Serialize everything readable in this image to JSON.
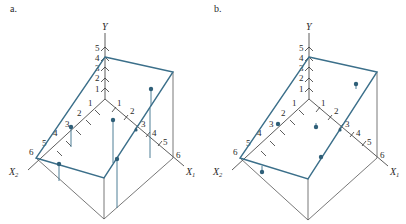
{
  "figure": {
    "panels": [
      {
        "id": "a",
        "label": "a.",
        "y_axis": {
          "label": "Y",
          "ticks": [
            "1",
            "2",
            "3",
            "4",
            "5"
          ]
        },
        "x1_axis": {
          "label": "X",
          "subscript": "1",
          "ticks": [
            "1",
            "2",
            "3",
            "4",
            "5",
            "6"
          ]
        },
        "x2_axis": {
          "label": "X",
          "subscript": "2",
          "ticks": [
            "1",
            "2",
            "3",
            "4",
            "5",
            "6"
          ]
        },
        "description": "Regression plane with data points; vertical stems connect each point to the plane (long residual lines)"
      },
      {
        "id": "b",
        "label": "b.",
        "y_axis": {
          "label": "Y",
          "ticks": [
            "1",
            "2",
            "3",
            "4",
            "5"
          ]
        },
        "x1_axis": {
          "label": "X",
          "subscript": "1",
          "ticks": [
            "1",
            "2",
            "3",
            "4",
            "5",
            "6"
          ]
        },
        "x2_axis": {
          "label": "X",
          "subscript": "2",
          "ticks": [
            "1",
            "2",
            "3",
            "4",
            "5",
            "6"
          ]
        },
        "description": "Same regression plane with data points close to the plane (short residual lines)"
      }
    ],
    "colors": {
      "plane": "#3b6f8a",
      "points": "#2f5f78",
      "axes": "#333333"
    }
  }
}
